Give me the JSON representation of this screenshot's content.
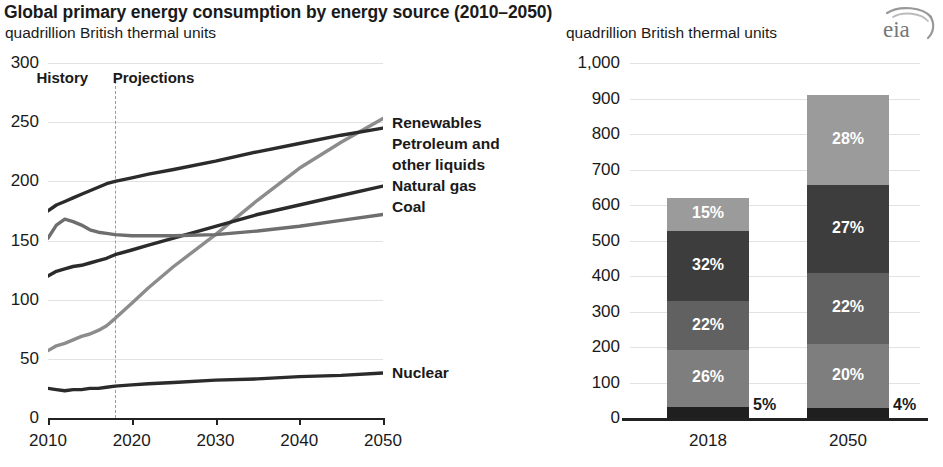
{
  "header": {
    "title": "Global primary energy consumption by energy source (2010–2050)",
    "subtitle_left": "quadrillion British thermal units",
    "subtitle_right": "quadrillion British thermal units",
    "logo": "eia"
  },
  "chart_data": [
    {
      "type": "line",
      "id": "left",
      "title": "",
      "ylabel": "quadrillion British thermal units",
      "xlabel": "",
      "xlim": [
        2010,
        2050
      ],
      "ylim": [
        0,
        300
      ],
      "yticks": [
        "0",
        "50",
        "100",
        "150",
        "200",
        "250",
        "300"
      ],
      "ytick_values": [
        0,
        50,
        100,
        150,
        200,
        250,
        300
      ],
      "xticks": [
        "2010",
        "2020",
        "2030",
        "2040",
        "2050"
      ],
      "xtick_values": [
        2010,
        2020,
        2030,
        2040,
        2050
      ],
      "grid": true,
      "legend_position": "right-of-plot",
      "annotations": [
        {
          "text": "History",
          "x": 2013.4,
          "y": 288
        },
        {
          "text": "Projections",
          "x": 2022.5,
          "y": 288
        }
      ],
      "divider_x": 2018,
      "x": [
        2010,
        2011,
        2012,
        2013,
        2014,
        2015,
        2016,
        2017,
        2018,
        2020,
        2022,
        2025,
        2030,
        2035,
        2040,
        2045,
        2050
      ],
      "series": [
        {
          "name": "Renewables",
          "color": "#8c8c8c",
          "values": [
            57,
            61,
            63,
            66,
            69,
            71,
            74,
            78,
            84,
            97,
            110,
            128,
            155,
            184,
            211,
            233,
            253
          ]
        },
        {
          "name": "Petroleum and other liquids",
          "color": "#2b2b2b",
          "values": [
            175,
            180,
            183,
            186,
            189,
            192,
            195,
            198,
            200,
            203,
            206,
            210,
            217,
            225,
            232,
            239,
            245
          ]
        },
        {
          "name": "Natural gas",
          "color": "#2b2b2b",
          "values": [
            120,
            124,
            126,
            128,
            129,
            131,
            133,
            135,
            138,
            142,
            146,
            152,
            162,
            172,
            180,
            188,
            196
          ]
        },
        {
          "name": "Coal",
          "color": "#6e6e6e",
          "values": [
            152,
            163,
            168,
            166,
            163,
            159,
            157,
            156,
            155,
            154,
            154,
            154,
            155,
            158,
            162,
            167,
            172
          ]
        },
        {
          "name": "Nuclear",
          "color": "#2b2b2b",
          "values": [
            25,
            24,
            23,
            24,
            24,
            25,
            25,
            26,
            27,
            28,
            29,
            30,
            32,
            33,
            35,
            36,
            38
          ]
        }
      ],
      "legend": [
        {
          "label": "Renewables"
        },
        {
          "label": "Petroleum and"
        },
        {
          "label": "other liquids"
        },
        {
          "label": "Natural gas"
        },
        {
          "label": "Coal"
        },
        {
          "label": "Nuclear"
        }
      ]
    },
    {
      "type": "bar",
      "id": "right",
      "subtype": "stacked",
      "ylabel": "quadrillion British thermal units",
      "ylim": [
        0,
        1000
      ],
      "yticks": [
        "0",
        "100",
        "200",
        "300",
        "400",
        "500",
        "600",
        "700",
        "800",
        "900",
        "1,000"
      ],
      "ytick_values": [
        0,
        100,
        200,
        300,
        400,
        500,
        600,
        700,
        800,
        900,
        1000
      ],
      "categories": [
        "2018",
        "2050"
      ],
      "grid": true,
      "bars": [
        {
          "category": "2018",
          "total": 620,
          "segments": [
            {
              "name": "Renewables",
              "label": "15%",
              "percent": 15,
              "color": "#9b9b9b",
              "value": 93
            },
            {
              "name": "Petroleum and other liquids",
              "label": "32%",
              "percent": 32,
              "color": "#3d3d3d",
              "value": 198
            },
            {
              "name": "Coal",
              "label": "22%",
              "percent": 22,
              "color": "#616161",
              "value": 136
            },
            {
              "name": "Natural gas",
              "label": "26%",
              "percent": 26,
              "color": "#7e7e7e",
              "value": 161
            },
            {
              "name": "Nuclear",
              "label": "5%",
              "percent": 5,
              "color": "#1f1f1f",
              "value": 31
            }
          ],
          "outside_label": "5%"
        },
        {
          "category": "2050",
          "total": 910,
          "segments": [
            {
              "name": "Renewables",
              "label": "28%",
              "percent": 28,
              "color": "#9b9b9b",
              "value": 255
            },
            {
              "name": "Petroleum and other liquids",
              "label": "27%",
              "percent": 27,
              "color": "#3d3d3d",
              "value": 246
            },
            {
              "name": "Coal",
              "label": "22%",
              "percent": 22,
              "color": "#616161",
              "value": 200
            },
            {
              "name": "Natural gas",
              "label": "20%",
              "percent": 20,
              "color": "#7e7e7e",
              "value": 182
            },
            {
              "name": "Nuclear",
              "label": "4%",
              "percent": 4,
              "color": "#1f1f1f",
              "value": 36
            }
          ],
          "outside_label": "4%"
        }
      ]
    }
  ]
}
